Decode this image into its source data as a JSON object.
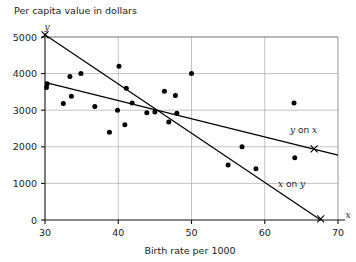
{
  "chart_data": {
    "type": "scatter",
    "title": "Per capita value in dollars",
    "xlabel": "Birth rate per 1000",
    "ylabel": "Per capita value in dollars",
    "x_axis_letter": "x",
    "y_axis_letter": "y",
    "xlim": [
      30,
      70
    ],
    "ylim": [
      0,
      5000
    ],
    "xticks": [
      30,
      40,
      50,
      60,
      70
    ],
    "xtick_labels": [
      "30",
      "40",
      "50",
      "60",
      "70"
    ],
    "yticks": [
      0,
      1000,
      2000,
      3000,
      4000,
      5000
    ],
    "ytick_labels": [
      "0",
      "1000",
      "2000",
      "3000",
      "4000",
      "5000"
    ],
    "grid": true,
    "legend_position": "inline-annotations",
    "points": [
      {
        "x": 30.2,
        "y": 3620
      },
      {
        "x": 30.3,
        "y": 3720
      },
      {
        "x": 32.5,
        "y": 3180
      },
      {
        "x": 33.4,
        "y": 3920
      },
      {
        "x": 33.6,
        "y": 3380
      },
      {
        "x": 34.9,
        "y": 4000
      },
      {
        "x": 36.8,
        "y": 3100
      },
      {
        "x": 38.8,
        "y": 2400
      },
      {
        "x": 39.9,
        "y": 3000
      },
      {
        "x": 40.1,
        "y": 4200
      },
      {
        "x": 40.9,
        "y": 2600
      },
      {
        "x": 41.1,
        "y": 3600
      },
      {
        "x": 41.9,
        "y": 3200
      },
      {
        "x": 43.9,
        "y": 2930
      },
      {
        "x": 45.0,
        "y": 2950
      },
      {
        "x": 46.3,
        "y": 3520
      },
      {
        "x": 46.9,
        "y": 2680
      },
      {
        "x": 47.8,
        "y": 3400
      },
      {
        "x": 48.0,
        "y": 2920
      },
      {
        "x": 50.0,
        "y": 4000
      },
      {
        "x": 55.0,
        "y": 1500
      },
      {
        "x": 56.9,
        "y": 2000
      },
      {
        "x": 58.8,
        "y": 1400
      },
      {
        "x": 64.0,
        "y": 3200
      },
      {
        "x": 64.1,
        "y": 1700
      }
    ],
    "lines": [
      {
        "name": "y on x",
        "label": "y on x",
        "label_italic_parts": [
          "y",
          "x"
        ],
        "from": {
          "x": 30,
          "y": 3760
        },
        "to": {
          "x": 70,
          "y": 1770
        },
        "end_marker": {
          "x": 66.0,
          "y": 1970,
          "type": "x-cross"
        },
        "label_pos": {
          "x": 63.5,
          "y": 2380
        }
      },
      {
        "name": "x on y",
        "label": "x on y",
        "label_italic_parts": [
          "x",
          "y"
        ],
        "from": {
          "x": 30,
          "y": 5060
        },
        "to": {
          "x": 67.6,
          "y": 0
        },
        "end_marker": {
          "x": 67.6,
          "y": 30,
          "type": "x-cross"
        },
        "label_pos": {
          "x": 61.0,
          "y": 880
        }
      }
    ],
    "y_axis_top_marker": {
      "x": 30,
      "y": 5060,
      "type": "x-cross"
    }
  }
}
